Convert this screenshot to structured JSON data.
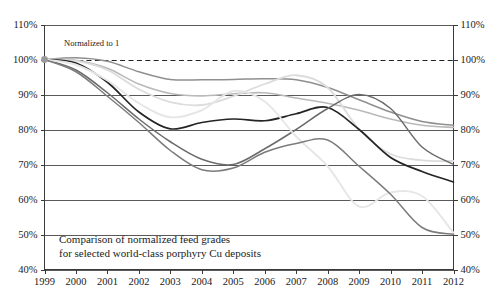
{
  "chart_data": {
    "type": "line",
    "title": "",
    "caption_line1": "Comparison of normalized feed grades",
    "caption_line2": "for selected world-class porphyry Cu deposits",
    "annotation": "Normalized to 1",
    "xlabel": "",
    "ylabel": "",
    "grid": true,
    "legend": "none",
    "xlim": [
      1999,
      2012
    ],
    "ylim": [
      40,
      110
    ],
    "y_tick_labels": [
      "110%",
      "100%",
      "90%",
      "80%",
      "70%",
      "60%",
      "50%",
      "40%"
    ],
    "y_tick_values": [
      110,
      100,
      90,
      80,
      70,
      60,
      50,
      40
    ],
    "y_axis_right_tick_labels": [
      "110%",
      "100%",
      "90%",
      "80%",
      "70%",
      "60%",
      "50%",
      "40%"
    ],
    "x_tick_labels": [
      "1999",
      "2000",
      "2001",
      "2002",
      "2003",
      "2004",
      "2005",
      "2006",
      "2007",
      "2008",
      "2009",
      "2010",
      "2011",
      "2012"
    ],
    "x": [
      1999,
      2000,
      2001,
      2002,
      2003,
      2004,
      2005,
      2006,
      2007,
      2008,
      2009,
      2010,
      2011,
      2012
    ],
    "reference_line": {
      "value": 100,
      "style": "dashed",
      "color": "#222222"
    },
    "series": [
      {
        "name": "deposit-a-medium-gray",
        "color": "#8f8f8f",
        "width": 1.5,
        "values": [
          100,
          100.5,
          99.5,
          96.5,
          94.3,
          94.2,
          94.3,
          94.5,
          94.2,
          92.0,
          88.5,
          85.0,
          82.3,
          81.2
        ]
      },
      {
        "name": "deposit-b-light-gray",
        "color": "#b9b9b9",
        "width": 1.6,
        "values": [
          100,
          99.8,
          97.5,
          93.0,
          90.3,
          89.6,
          90.2,
          90.5,
          89.0,
          87.5,
          85.5,
          83.0,
          81.2,
          80.6
        ]
      },
      {
        "name": "deposit-c-pale-gray",
        "color": "#dcdcdc",
        "width": 1.8,
        "values": [
          100,
          99.6,
          97.0,
          91.5,
          87.8,
          87.0,
          89.5,
          93.0,
          95.5,
          92.0,
          80.0,
          73.0,
          71.2,
          71.0
        ]
      },
      {
        "name": "deposit-d-black",
        "color": "#252525",
        "width": 1.7,
        "values": [
          100,
          99.0,
          93.5,
          85.0,
          80.2,
          82.0,
          83.0,
          82.5,
          84.5,
          86.3,
          80.0,
          72.0,
          68.0,
          65.0
        ]
      },
      {
        "name": "deposit-e-dark-gray",
        "color": "#6b6b6b",
        "width": 1.5,
        "values": [
          100,
          97.0,
          90.5,
          83.0,
          76.5,
          71.5,
          70.0,
          74.5,
          80.0,
          86.0,
          90.0,
          86.0,
          75.0,
          70.0
        ]
      },
      {
        "name": "deposit-f-very-light",
        "color": "#e6e6e6",
        "width": 1.9,
        "values": [
          100,
          98.5,
          94.0,
          87.5,
          83.5,
          85.5,
          91.0,
          88.0,
          78.0,
          69.5,
          58.0,
          62.0,
          61.0,
          50.5
        ]
      },
      {
        "name": "deposit-g-mid-gray",
        "color": "#7c7c7c",
        "width": 1.5,
        "values": [
          100,
          96.5,
          89.5,
          82.0,
          74.0,
          68.5,
          69.0,
          73.5,
          76.0,
          77.0,
          69.5,
          61.5,
          52.0,
          50.0
        ]
      }
    ],
    "marker": {
      "x": 1999,
      "y": 100,
      "color": "#9a9a9a",
      "radius": 3.4
    }
  }
}
